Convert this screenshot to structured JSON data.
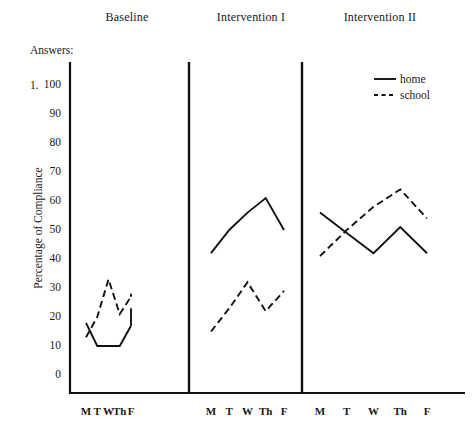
{
  "headers": {
    "phases": [
      "Baseline",
      "Intervention I",
      "Intervention II"
    ]
  },
  "answers": {
    "label": "Answers:",
    "number": "1."
  },
  "legend": {
    "home": "home",
    "school": "school"
  },
  "chart_data": {
    "type": "line",
    "title": "",
    "xlabel": "",
    "ylabel": "Percentage of Compliance",
    "ylim": [
      0,
      100
    ],
    "ytick_labels": [
      "0",
      "10",
      "20",
      "30",
      "40",
      "50",
      "60",
      "70",
      "80",
      "90",
      "100"
    ],
    "ytick_values": [
      0,
      10,
      20,
      30,
      40,
      50,
      60,
      70,
      80,
      90,
      100
    ],
    "grid": false,
    "legend_position": "top-right",
    "legend_entries": [
      "home",
      "school"
    ],
    "phases": [
      "Baseline",
      "Intervention I",
      "Intervention II"
    ],
    "categories": [
      "M",
      "T",
      "W",
      "Th",
      "F"
    ],
    "xtick_labels": [
      [
        "M",
        "T",
        "W",
        "Th",
        "F"
      ],
      [
        "M",
        "T",
        "W",
        "Th",
        "F"
      ],
      [
        "M",
        "T",
        "W",
        "Th",
        "F"
      ]
    ],
    "series": [
      {
        "name": "home",
        "style": "solid",
        "color": "#111111",
        "phase_values": [
          [
            18,
            10,
            10,
            10,
            17
          ],
          [
            42,
            50,
            56,
            61,
            50
          ],
          [
            56,
            49,
            42,
            51,
            42
          ]
        ]
      },
      {
        "name": "school",
        "style": "dashed",
        "color": "#111111",
        "phase_values": [
          [
            13,
            20,
            33,
            21,
            27
          ],
          [
            15,
            23,
            32,
            22,
            29
          ],
          [
            41,
            50,
            58,
            64,
            54
          ]
        ]
      }
    ],
    "extra_segments": [
      {
        "series": "home",
        "phase": 0,
        "note": "tail rising segment after F",
        "points": [
          [
            4,
            17
          ],
          [
            5.1,
            23
          ]
        ]
      },
      {
        "series": "school",
        "phase": 0,
        "note": "tail rising segment after F",
        "points": [
          [
            4,
            27
          ],
          [
            5.1,
            28
          ]
        ]
      }
    ]
  }
}
